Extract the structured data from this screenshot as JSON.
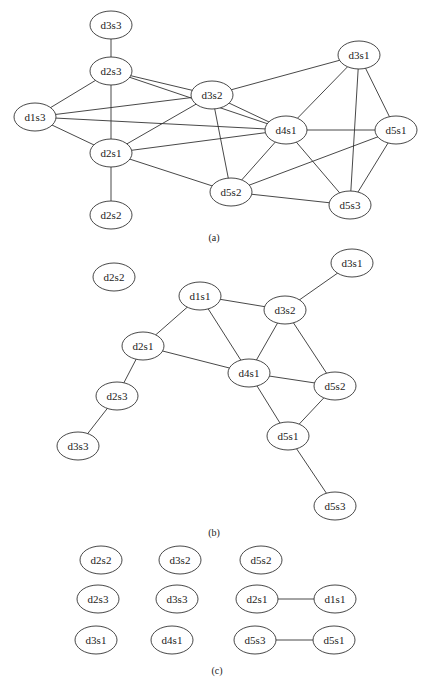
{
  "figure": {
    "panels": [
      {
        "id": "a",
        "caption": "(a)",
        "nodes": [
          "d3s3",
          "d2s3",
          "d3s2",
          "d3s1",
          "d1s3",
          "d4s1",
          "d5s1",
          "d2s1",
          "d2s2",
          "d5s2",
          "d5s3"
        ],
        "edges": [
          [
            "d3s3",
            "d2s3"
          ],
          [
            "d2s3",
            "d1s3"
          ],
          [
            "d2s3",
            "d2s1"
          ],
          [
            "d2s3",
            "d3s2"
          ],
          [
            "d2s3",
            "d4s1"
          ],
          [
            "d1s3",
            "d3s2"
          ],
          [
            "d1s3",
            "d4s1"
          ],
          [
            "d1s3",
            "d2s1"
          ],
          [
            "d2s1",
            "d3s2"
          ],
          [
            "d2s1",
            "d4s1"
          ],
          [
            "d2s1",
            "d5s2"
          ],
          [
            "d2s1",
            "d2s2"
          ],
          [
            "d3s2",
            "d3s1"
          ],
          [
            "d3s2",
            "d4s1"
          ],
          [
            "d3s2",
            "d5s2"
          ],
          [
            "d3s1",
            "d4s1"
          ],
          [
            "d3s1",
            "d5s3"
          ],
          [
            "d3s1",
            "d5s1"
          ],
          [
            "d4s1",
            "d5s1"
          ],
          [
            "d4s1",
            "d5s2"
          ],
          [
            "d4s1",
            "d5s3"
          ],
          [
            "d5s1",
            "d5s2"
          ],
          [
            "d5s1",
            "d5s3"
          ],
          [
            "d5s2",
            "d5s3"
          ]
        ]
      },
      {
        "id": "b",
        "caption": "(b)",
        "nodes": [
          "d2s2",
          "d3s1",
          "d1s1",
          "d3s2",
          "d2s1",
          "d4s1",
          "d5s2",
          "d2s3",
          "d5s1",
          "d3s3",
          "d5s3"
        ],
        "edges": [
          [
            "d1s1",
            "d2s1"
          ],
          [
            "d1s1",
            "d3s2"
          ],
          [
            "d1s1",
            "d4s1"
          ],
          [
            "d3s1",
            "d3s2"
          ],
          [
            "d3s2",
            "d4s1"
          ],
          [
            "d3s2",
            "d5s2"
          ],
          [
            "d2s1",
            "d4s1"
          ],
          [
            "d2s1",
            "d2s3"
          ],
          [
            "d2s3",
            "d3s3"
          ],
          [
            "d4s1",
            "d5s2"
          ],
          [
            "d4s1",
            "d5s1"
          ],
          [
            "d5s2",
            "d5s1"
          ],
          [
            "d5s1",
            "d5s3"
          ]
        ]
      },
      {
        "id": "c",
        "caption": "(c)",
        "nodes": [
          "d2s2",
          "d3s2",
          "d5s2",
          "d2s3",
          "d3s3",
          "d2s1",
          "d1s1",
          "d3s1",
          "d4s1",
          "d5s3",
          "d5s1"
        ],
        "edges": [
          [
            "d2s1",
            "d1s1"
          ],
          [
            "d5s3",
            "d5s1"
          ]
        ]
      }
    ]
  }
}
